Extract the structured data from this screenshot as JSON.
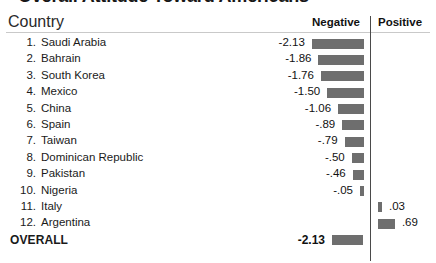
{
  "chart_data": {
    "type": "bar",
    "title": "Overall Attitude Toward Americans",
    "xlabel": "",
    "ylabel": "Country",
    "grid": false,
    "legend_position": "top-right",
    "axis_divider_label_left": "Negative",
    "axis_divider_label_right": "Positive",
    "categories": [
      "Saudi Arabia",
      "Bahrain",
      "South Korea",
      "Mexico",
      "China",
      "Spain",
      "Taiwan",
      "Dominican Republic",
      "Pakistan",
      "Nigeria",
      "Italy",
      "Argentina"
    ],
    "values": [
      -2.13,
      -1.86,
      -1.76,
      -1.5,
      -1.06,
      -0.89,
      -0.79,
      -0.5,
      -0.46,
      -0.05,
      0.03,
      0.69
    ],
    "value_labels": [
      "-2.13",
      "-1.86",
      "-1.76",
      "-1.50",
      "-1.06",
      "-.89",
      "-.79",
      "-.50",
      "-.46",
      "-.05",
      ".03",
      ".69"
    ],
    "xlim": [
      -2.4,
      1.0
    ],
    "summary": {
      "label": "OVERALL",
      "value": -2.13,
      "value_label": "-2.13"
    },
    "bar_color": "#6e6e6e"
  },
  "header": {
    "title": "Overall Attitude Toward Americans",
    "country_label": "Country",
    "negative_label": "Negative",
    "positive_label": "Positive"
  },
  "rows": [
    {
      "rank": "1.",
      "country": "Saudi Arabia",
      "value_label": "-2.13",
      "value": -2.13
    },
    {
      "rank": "2.",
      "country": "Bahrain",
      "value_label": "-1.86",
      "value": -1.86
    },
    {
      "rank": "3.",
      "country": "South Korea",
      "value_label": "-1.76",
      "value": -1.76
    },
    {
      "rank": "4.",
      "country": "Mexico",
      "value_label": "-1.50",
      "value": -1.5
    },
    {
      "rank": "5.",
      "country": "China",
      "value_label": "-1.06",
      "value": -1.06
    },
    {
      "rank": "6.",
      "country": "Spain",
      "value_label": "-.89",
      "value": -0.89
    },
    {
      "rank": "7.",
      "country": "Taiwan",
      "value_label": "-.79",
      "value": -0.79
    },
    {
      "rank": "8.",
      "country": "Dominican Republic",
      "value_label": "-.50",
      "value": -0.5
    },
    {
      "rank": "9.",
      "country": "Pakistan",
      "value_label": "-.46",
      "value": -0.46
    },
    {
      "rank": "10.",
      "country": "Nigeria",
      "value_label": "-.05",
      "value": -0.05
    },
    {
      "rank": "11.",
      "country": "Italy",
      "value_label": ".03",
      "value": 0.03
    },
    {
      "rank": "12.",
      "country": "Argentina",
      "value_label": ".69",
      "value": 0.69
    }
  ],
  "overall": {
    "label": "OVERALL",
    "value_label": "-2.13",
    "value": -2.13
  }
}
